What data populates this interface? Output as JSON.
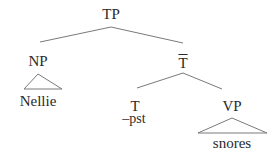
{
  "diagram": {
    "type": "syntax-tree",
    "line_color": "#7a7a7a",
    "nodes": {
      "tp": {
        "label": "TP"
      },
      "np": {
        "label": "NP"
      },
      "nellie": {
        "label": "Nellie"
      },
      "tbar": {
        "label": "T"
      },
      "t": {
        "label": "T"
      },
      "t_feature": {
        "label": "–pst"
      },
      "vp": {
        "label": "VP"
      },
      "snores": {
        "label": "snores"
      }
    },
    "structure": {
      "TP": [
        "NP",
        "T-bar"
      ],
      "NP": [
        "Nellie (triangle)"
      ],
      "T-bar": [
        "T",
        "VP"
      ],
      "T": [
        "–pst"
      ],
      "VP": [
        "snores (triangle)"
      ]
    }
  }
}
